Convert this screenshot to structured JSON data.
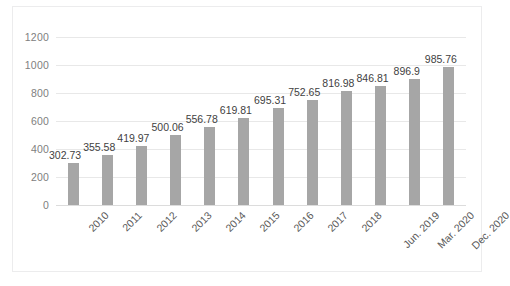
{
  "chart_data": {
    "type": "bar",
    "title": "",
    "subtitle": "",
    "xlabel": "",
    "ylabel": "",
    "categories": [
      "2010",
      "2011",
      "2012",
      "2013",
      "2014",
      "2015",
      "2016",
      "2017",
      "2018",
      "Jun. 2019",
      "Mar. 2020",
      "Dec. 2020"
    ],
    "values": [
      302.73,
      355.58,
      419.97,
      500.06,
      556.78,
      619.81,
      695.31,
      752.65,
      816.98,
      846.81,
      896.9,
      985.76
    ],
    "data_labels": [
      "302.73",
      "355.58",
      "419.97",
      "500.06",
      "556.78",
      "619.81",
      "695.31",
      "752.65",
      "816.98",
      "846.81",
      "896.9",
      "985.76"
    ],
    "ylim": [
      0,
      1200
    ],
    "yticks": [
      0,
      200,
      400,
      600,
      800,
      1000,
      1200
    ],
    "ytick_labels": [
      "0",
      "200",
      "400",
      "600",
      "800",
      "1000",
      "1200"
    ],
    "grid": true,
    "grid_axis": "y",
    "legend": false,
    "legend_position": "none",
    "bar_color": "#a6a6a6",
    "grid_color": "#e8e8e8",
    "tick_label_color": "#808080",
    "data_label_color": "#3f3f3f",
    "xtick_rotation_deg": -45,
    "background_color": "#ffffff"
  }
}
